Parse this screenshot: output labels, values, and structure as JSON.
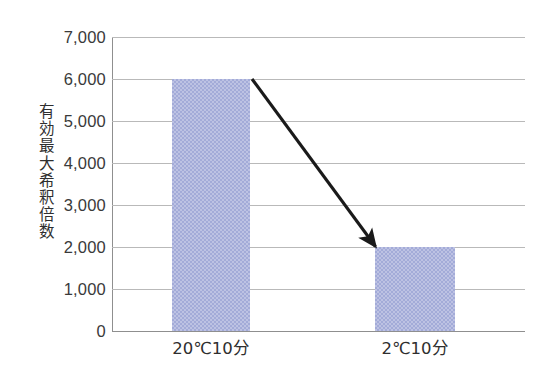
{
  "chart_data": {
    "type": "bar",
    "title": "",
    "subtitle": "",
    "xlabel": "",
    "ylabel": "有効最大希釈倍数",
    "categories": [
      "20℃10分",
      "2℃10分"
    ],
    "values": [
      6000,
      2000
    ],
    "series": [
      {
        "name": "有効最大希釈倍数",
        "values": [
          6000,
          2000
        ]
      }
    ],
    "ylim": [
      0,
      7000
    ],
    "ytick_values": [
      0,
      1000,
      2000,
      3000,
      4000,
      5000,
      6000,
      7000
    ],
    "ytick_labels": [
      "0",
      "1,000",
      "2,000",
      "3,000",
      "4,000",
      "5,000",
      "6,000",
      "7,000"
    ],
    "grid": true,
    "grid_axis": "y",
    "legend": false,
    "legend_position": "none",
    "bar_color": "#a3abd8",
    "bar_pattern": "fine-checker",
    "gridline_color": "#b9b9b9",
    "axis_color": "#8f8f8f",
    "background_color": "#ffffff",
    "annotations": [
      {
        "type": "arrow",
        "name": "decline-arrow",
        "color": "#1a1a1a",
        "from_category": "20℃10分",
        "from_value": 6000,
        "to_category": "2℃10分",
        "to_value": 2000,
        "label": ""
      }
    ]
  },
  "axes": {
    "y_title": "有効最大希釈倍数",
    "y_ticks": [
      {
        "label": "7,000",
        "value": 7000
      },
      {
        "label": "6,000",
        "value": 6000
      },
      {
        "label": "5,000",
        "value": 5000
      },
      {
        "label": "4,000",
        "value": 4000
      },
      {
        "label": "3,000",
        "value": 3000
      },
      {
        "label": "2,000",
        "value": 2000
      },
      {
        "label": "1,000",
        "value": 1000
      },
      {
        "label": "0",
        "value": 0
      }
    ],
    "x_ticks": [
      {
        "label": "20℃10分"
      },
      {
        "label": "2℃10分"
      }
    ]
  }
}
